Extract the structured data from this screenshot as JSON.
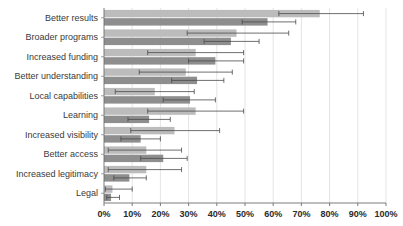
{
  "chart_data": {
    "type": "bar",
    "orientation": "horizontal",
    "title": "",
    "subtitle": "",
    "xlabel": "",
    "ylabel": "",
    "xlim": [
      0,
      100
    ],
    "grid": true,
    "legend_position": "none",
    "categories": [
      "Better results",
      "Broader programs",
      "Increased funding",
      "Better understanding",
      "Local capabilities",
      "Learning",
      "Increased visibility",
      "Better access",
      "Increased legitimacy",
      "Legal"
    ],
    "xticks": [
      0,
      10,
      20,
      30,
      40,
      50,
      60,
      70,
      80,
      90,
      100
    ],
    "xtick_labels": [
      "0%",
      "10%",
      "20%",
      "30%",
      "40%",
      "50%",
      "60%",
      "70%",
      "80%",
      "90%",
      "100%"
    ],
    "series": [
      {
        "name": "light-series",
        "color": "#bcbcbc",
        "values": [
          76.5,
          47.0,
          32.5,
          29.0,
          18.0,
          32.5,
          25.0,
          15.0,
          15.0,
          3.0
        ],
        "err_low": [
          62.0,
          29.5,
          15.5,
          12.5,
          4.0,
          15.5,
          9.5,
          1.5,
          1.5,
          0.5
        ],
        "err_high": [
          92.0,
          65.5,
          49.5,
          45.5,
          32.0,
          49.5,
          41.0,
          27.5,
          27.5,
          10.0
        ]
      },
      {
        "name": "dark-series",
        "color": "#8e8e8e",
        "values": [
          58.0,
          45.0,
          39.5,
          33.0,
          30.5,
          16.0,
          13.0,
          21.0,
          9.0,
          2.5
        ],
        "err_low": [
          49.0,
          35.5,
          30.0,
          24.0,
          21.0,
          8.5,
          6.0,
          13.0,
          3.5,
          1.0
        ],
        "err_high": [
          68.0,
          55.0,
          49.5,
          42.5,
          39.5,
          23.5,
          20.0,
          29.5,
          15.0,
          5.5
        ]
      }
    ]
  },
  "axis": {
    "plot_left_px": 104,
    "plot_right_px": 386,
    "plot_top_px": 8,
    "plot_bottom_px": 203
  }
}
